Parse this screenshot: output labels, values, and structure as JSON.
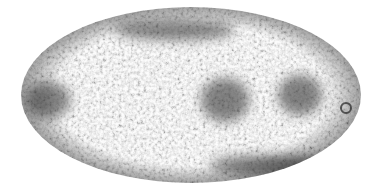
{
  "image": {
    "description": "All-sky map in elliptical (Mollweide) projection with mottled grayscale anisotropy texture",
    "projection": "mollweide",
    "colormap": "grayscale",
    "background": "#ffffff",
    "ellipse": {
      "cx": 191,
      "cy": 95,
      "rx": 170,
      "ry": 88
    },
    "palette": {
      "light": "#e8e8e8",
      "mid": "#9a9a9a",
      "dark": "#222222"
    },
    "dark_regions": [
      {
        "name": "left-cluster",
        "cx": 48,
        "cy": 100,
        "rx": 22,
        "ry": 18
      },
      {
        "name": "center-cluster",
        "cx": 225,
        "cy": 100,
        "rx": 24,
        "ry": 22
      },
      {
        "name": "right-cluster",
        "cx": 300,
        "cy": 95,
        "rx": 22,
        "ry": 20
      },
      {
        "name": "upper-band",
        "cx": 175,
        "cy": 30,
        "rx": 60,
        "ry": 10
      },
      {
        "name": "lower-band",
        "cx": 270,
        "cy": 165,
        "rx": 60,
        "ry": 10
      }
    ],
    "ring_feature": {
      "cx": 346,
      "cy": 108,
      "r": 5
    }
  }
}
